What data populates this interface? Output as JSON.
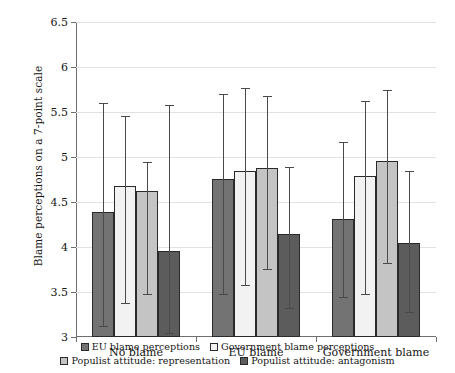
{
  "chart_data": {
    "type": "bar",
    "title": "",
    "subtitle": "",
    "xlabel": "",
    "ylabel": "Blame perceptions on a 7-point scale",
    "ylim": [
      3,
      6.5
    ],
    "yticks": [
      3,
      3.5,
      4,
      4.5,
      5,
      5.5,
      6,
      6.5
    ],
    "ytick_labels": [
      "3",
      "3.5",
      "4",
      "4.5",
      "5",
      "5.5",
      "6",
      "6.5"
    ],
    "grid": true,
    "legend_position": "bottom",
    "categories": [
      "No blame",
      "EU blame",
      "Government blame"
    ],
    "series": [
      {
        "name": "EU blame perceptions",
        "color": "#737373",
        "values": [
          4.39,
          4.76,
          4.31
        ],
        "err_low": [
          3.12,
          3.48,
          3.44
        ],
        "err_high": [
          5.6,
          5.7,
          5.17
        ]
      },
      {
        "name": "Government blame perceptions",
        "color": "#f2f2f2",
        "values": [
          4.68,
          4.84,
          4.79
        ],
        "err_low": [
          3.38,
          3.58,
          3.48
        ],
        "err_high": [
          5.46,
          5.77,
          5.62
        ]
      },
      {
        "name": "Populist attitude: representation",
        "color": "#c4c4c4",
        "values": [
          4.62,
          4.88,
          4.96
        ],
        "err_low": [
          3.48,
          3.76,
          3.82
        ],
        "err_high": [
          4.94,
          5.68,
          5.75
        ]
      },
      {
        "name": "Populist attitude: antagonism",
        "color": "#5c5c5c",
        "values": [
          3.96,
          4.14,
          4.05
        ],
        "err_low": [
          3.04,
          3.32,
          3.28
        ],
        "err_high": [
          5.58,
          4.89,
          4.85
        ]
      }
    ]
  },
  "axis": {
    "y_title": "Blame perceptions on a 7-point scale"
  },
  "legend": {
    "rows": [
      [
        "EU blame perceptions",
        "Government blame perceptions"
      ],
      [
        "Populist attitude: representation",
        "Populist attitude: antagonism"
      ]
    ]
  }
}
